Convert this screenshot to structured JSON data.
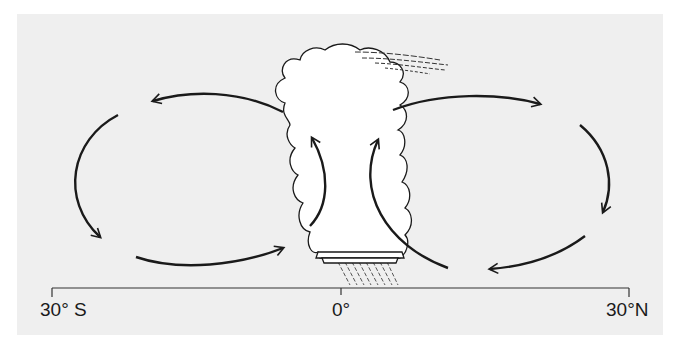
{
  "diagram": {
    "type": "atmospheric circulation cross-section (Hadley cells)",
    "axis": {
      "labels": {
        "south": "30° S",
        "equator": "0°",
        "north": "30°N"
      }
    },
    "elements": {
      "cloud": "cumulonimbus thunderstorm cloud over equator",
      "rain": "rain shafts below cloud",
      "anvil_wisps": "upper-level cirrus streaks blowing east",
      "cells": [
        {
          "name": "southern-cell",
          "direction": "rising at equator, flowing south aloft, sinking at 30° S, returning at surface"
        },
        {
          "name": "northern-cell",
          "direction": "rising at equator, flowing north aloft, sinking at 30° N, returning at surface"
        }
      ]
    },
    "colors": {
      "panel": "#efefef",
      "ink": "#1a1a1a",
      "cloud_fill": "#ffffff"
    }
  }
}
